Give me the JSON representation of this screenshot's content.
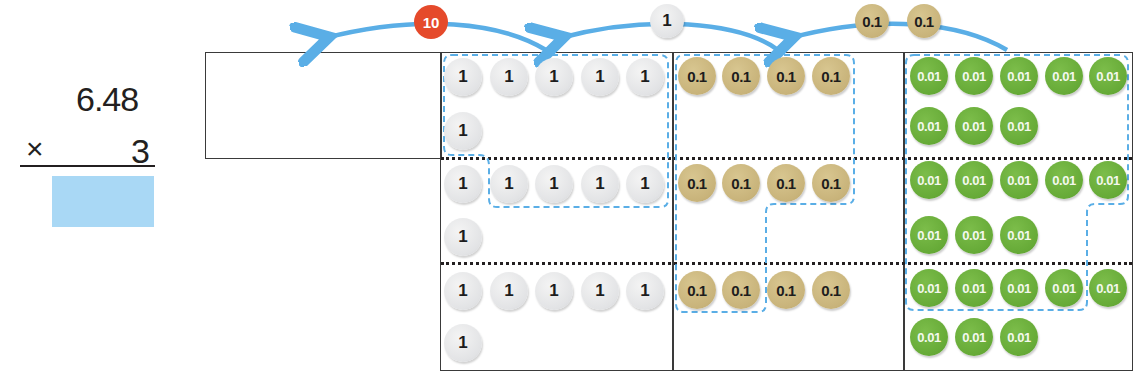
{
  "calculation": {
    "multiplicand": "6.48",
    "operator": "×",
    "multiplier": "3",
    "answer": ""
  },
  "colors": {
    "arrow": "#5aaee6",
    "dashed_group": "#5aaee6",
    "answer_box": "#a9d8f5",
    "ten_chip": "#e54a2b",
    "one_chip": "#e2e3e5",
    "tenth_chip": "#c8b37a",
    "hundredth_chip": "#66aa37"
  },
  "regroup_arrows": [
    {
      "chip_labels": [
        "10"
      ],
      "from": "ones",
      "to": "tens"
    },
    {
      "chip_labels": [
        "1"
      ],
      "from": "tenths",
      "to": "ones"
    },
    {
      "chip_labels": [
        "0.1",
        "0.1"
      ],
      "from": "hundredths",
      "to": "tenths"
    }
  ],
  "place_value_chart": {
    "columns": [
      "tens (empty)",
      "ones",
      "tenths",
      "hundredths"
    ],
    "rows": [
      {
        "ones": [
          "1",
          "1",
          "1",
          "1",
          "1",
          "1"
        ],
        "tenths": [
          "0.1",
          "0.1",
          "0.1",
          "0.1"
        ],
        "hundredths": [
          "0.01",
          "0.01",
          "0.01",
          "0.01",
          "0.01",
          "0.01",
          "0.01",
          "0.01"
        ]
      },
      {
        "ones": [
          "1",
          "1",
          "1",
          "1",
          "1",
          "1"
        ],
        "tenths": [
          "0.1",
          "0.1",
          "0.1",
          "0.1"
        ],
        "hundredths": [
          "0.01",
          "0.01",
          "0.01",
          "0.01",
          "0.01",
          "0.01",
          "0.01",
          "0.01"
        ]
      },
      {
        "ones": [
          "1",
          "1",
          "1",
          "1",
          "1",
          "1"
        ],
        "tenths": [
          "0.1",
          "0.1",
          "0.1",
          "0.1"
        ],
        "hundredths": [
          "0.01",
          "0.01",
          "0.01",
          "0.01",
          "0.01",
          "0.01",
          "0.01",
          "0.01"
        ]
      }
    ]
  },
  "labels": {
    "one": "1",
    "tenth": "0.1",
    "hundredth": "0.01",
    "ten": "10"
  }
}
